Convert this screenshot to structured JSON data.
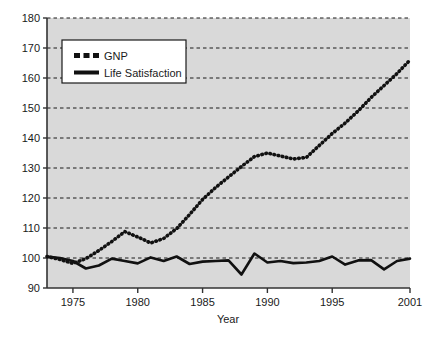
{
  "chart_data": {
    "type": "line",
    "title": "",
    "xlabel": "Year",
    "ylabel": "",
    "xlim": [
      1973,
      2001
    ],
    "ylim": [
      90,
      180
    ],
    "grid": true,
    "grid_axis": "y",
    "legend_position": "upper-left",
    "x_ticks": [
      1975,
      1980,
      1985,
      1990,
      1995,
      2001
    ],
    "x_tick_labels": [
      "1975",
      "1980",
      "1985",
      "1990",
      "1995",
      "2001"
    ],
    "y_ticks": [
      90,
      100,
      110,
      120,
      130,
      140,
      150,
      160,
      170,
      180
    ],
    "y_tick_labels": [
      "90",
      "100",
      "110",
      "120",
      "130",
      "140",
      "150",
      "160",
      "170",
      "180"
    ],
    "x": [
      1973,
      1974,
      1975,
      1976,
      1977,
      1978,
      1979,
      1980,
      1981,
      1982,
      1983,
      1984,
      1985,
      1986,
      1987,
      1988,
      1989,
      1990,
      1991,
      1992,
      1993,
      1994,
      1995,
      1996,
      1997,
      1998,
      1999,
      2000,
      2001
    ],
    "series": [
      {
        "name": "GNP",
        "style": "dotted",
        "color": "#111111",
        "values": [
          100.5,
          99.5,
          98.2,
          99.8,
          102.5,
          105.5,
          108.8,
          107.0,
          105.0,
          106.5,
          109.8,
          114.5,
          119.5,
          123.5,
          127.0,
          130.5,
          133.8,
          135.0,
          134.0,
          133.0,
          133.5,
          137.5,
          141.5,
          145.0,
          149.0,
          153.5,
          157.5,
          161.5,
          166.0
        ]
      },
      {
        "name": "Life Satisfaction",
        "style": "solid",
        "color": "#111111",
        "values": [
          100.5,
          100.0,
          99.0,
          96.5,
          97.5,
          99.8,
          99.0,
          98.2,
          100.2,
          99.0,
          100.5,
          98.0,
          98.8,
          99.0,
          99.2,
          94.5,
          101.5,
          98.5,
          99.0,
          98.3,
          98.5,
          99.0,
          100.5,
          97.8,
          99.2,
          99.3,
          96.2,
          99.0,
          99.8
        ]
      }
    ]
  },
  "legend": {
    "entries": [
      {
        "label": "GNP",
        "swatch": "dotted-swatch"
      },
      {
        "label": "Life Satisfaction",
        "swatch": "solid-swatch"
      }
    ]
  },
  "axes": {
    "x_axis_title": "Year"
  },
  "colors": {
    "plot_background": "#d9d9d9",
    "gridline": "#1a1a1a",
    "axis": "#333333",
    "series": "#111111",
    "legend_background": "#ffffff",
    "legend_border": "#1a1a1a",
    "page_background": "#ffffff"
  }
}
